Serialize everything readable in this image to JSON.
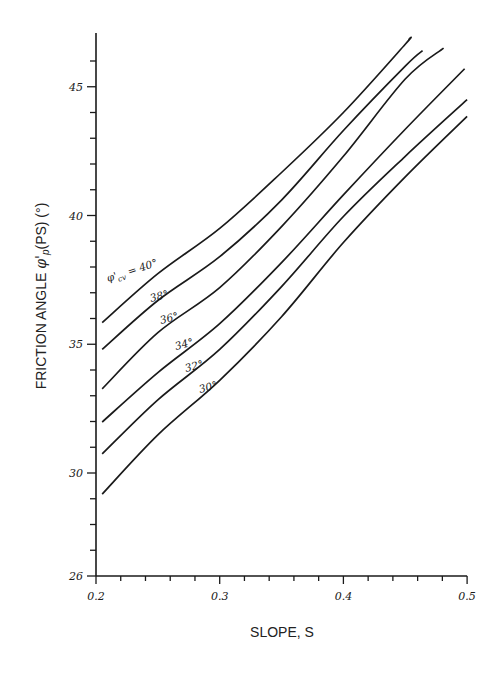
{
  "chart_data": {
    "type": "line",
    "title": "",
    "xlabel": "SLOPE, S",
    "ylabel": "FRICTION ANGLE φ'p(PS) (°)",
    "xlim": [
      0.2,
      0.5
    ],
    "ylim": [
      26,
      47.2
    ],
    "x_ticks": [
      0.2,
      0.3,
      0.4,
      0.5
    ],
    "x_tick_labels": [
      "0.2",
      "0.3",
      "0.4",
      "0.5"
    ],
    "x_minor_step": 0.02,
    "y_ticks": [
      26,
      30,
      35,
      40,
      45
    ],
    "y_tick_labels": [
      "26",
      "30",
      "35",
      "40",
      "45"
    ],
    "y_minor_step": 1,
    "grid": false,
    "legend": "inline labels on curves",
    "series_label_prefix": "φ'cv = ",
    "series": [
      {
        "name": "40°",
        "label": "40°",
        "x": [
          0.205,
          0.25,
          0.3,
          0.35,
          0.4,
          0.45,
          0.453
        ],
        "values": [
          35.84,
          37.74,
          39.5,
          41.67,
          44.0,
          46.65,
          46.85
        ]
      },
      {
        "name": "38°",
        "label": "38°",
        "x": [
          0.205,
          0.25,
          0.3,
          0.35,
          0.4,
          0.45,
          0.464
        ],
        "values": [
          34.8,
          36.7,
          38.4,
          40.6,
          43.3,
          45.8,
          46.4
        ]
      },
      {
        "name": "36°",
        "label": "36°",
        "x": [
          0.205,
          0.25,
          0.3,
          0.35,
          0.4,
          0.45,
          0.481
        ],
        "values": [
          33.27,
          35.45,
          37.2,
          39.57,
          42.3,
          45.3,
          46.5
        ]
      },
      {
        "name": "34°",
        "label": "34°",
        "x": [
          0.205,
          0.25,
          0.3,
          0.35,
          0.4,
          0.45,
          0.498
        ],
        "values": [
          31.98,
          33.9,
          35.8,
          38.17,
          40.8,
          43.35,
          45.7
        ]
      },
      {
        "name": "32°",
        "label": "32°",
        "x": [
          0.205,
          0.25,
          0.3,
          0.35,
          0.4,
          0.45,
          0.5
        ],
        "values": [
          30.74,
          32.84,
          34.8,
          37.24,
          39.96,
          42.3,
          44.5
        ]
      },
      {
        "name": "30°",
        "label": "30°",
        "x": [
          0.205,
          0.25,
          0.3,
          0.35,
          0.4,
          0.45,
          0.5
        ],
        "values": [
          29.18,
          31.48,
          33.6,
          36.07,
          38.95,
          41.5,
          43.85
        ]
      }
    ],
    "annotations": [
      {
        "text": "φ'cv = 40°",
        "series": "40°"
      },
      {
        "text": "38°",
        "series": "38°"
      },
      {
        "text": "36°",
        "series": "36°"
      },
      {
        "text": "34°",
        "series": "34°"
      },
      {
        "text": "32°",
        "series": "32°"
      },
      {
        "text": "30°",
        "series": "30°"
      }
    ]
  },
  "labels": {
    "x_axis_title": "SLOPE, S",
    "y_axis_title_main": "FRICTION ANGLE ",
    "y_axis_title_symbol": "φ'",
    "y_axis_title_sub": "p",
    "y_axis_title_tail": "(PS)  (°)",
    "first_curve_label_symbol": "φ'",
    "first_curve_label_sub": "cv",
    "first_curve_label_tail": " = 40°"
  }
}
